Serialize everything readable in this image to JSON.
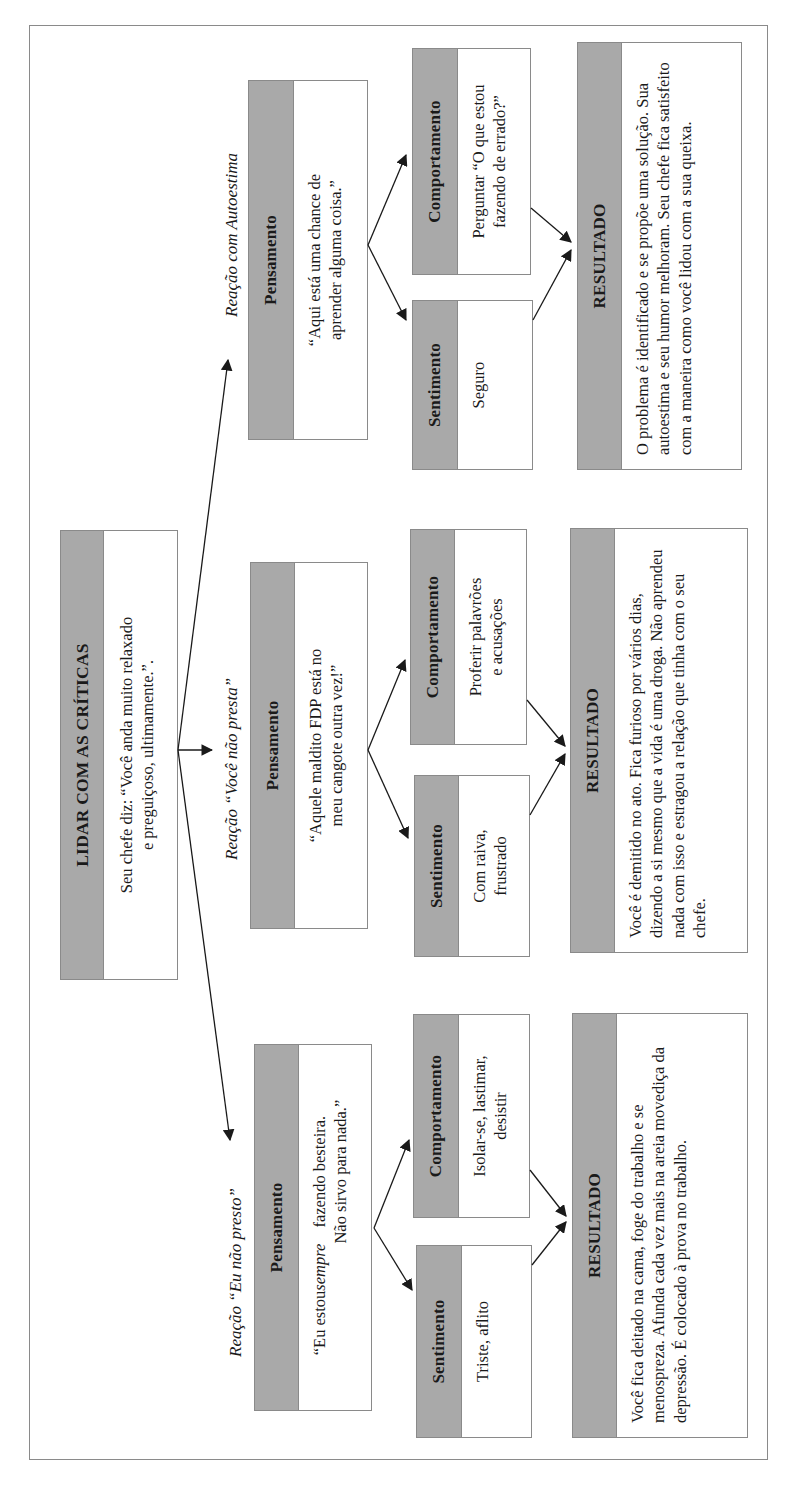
{
  "title_box": {
    "heading": "LIDAR COM AS CRÍTICAS",
    "text": "Seu chefe diz: “Você anda muito relaxado\ne preguiçoso, ultimamente.”."
  },
  "branches": [
    {
      "label": "Reação “Eu não presto”",
      "thought": {
        "heading": "Pensamento",
        "text_before": "“Eu estou ",
        "text_emphasis": "sempre",
        "text_after": " fazendo besteira.\nNão sirvo para nada.”"
      },
      "feeling": {
        "heading": "Sentimento",
        "text": "Triste, aflito"
      },
      "behavior": {
        "heading": "Comportamento",
        "text": "Isolar-se, lastimar,\ndesistir"
      },
      "result": {
        "heading": "RESULTADO",
        "text": "Você fica deitado na cama, foge do trabalho e se menospreza. Afunda cada vez mais na areia movediça da depressão. É colocado à prova no trabalho."
      }
    },
    {
      "label": "Reação “Você não presta”",
      "thought": {
        "heading": "Pensamento",
        "text": "“Aquele maldito FDP está no\nmeu cangote outra vez!”"
      },
      "feeling": {
        "heading": "Sentimento",
        "text": "Com raiva,\nfrustrado"
      },
      "behavior": {
        "heading": "Comportamento",
        "text": "Proferir palavrões\ne acusações"
      },
      "result": {
        "heading": "RESULTADO",
        "text": "Você é demitido no ato. Fica furioso por vários dias, dizendo a si mesmo que a vida é uma droga. Não aprendeu nada com isso e estragou a relação que tinha com o seu chefe."
      }
    },
    {
      "label": "Reação com Autoestima",
      "thought": {
        "heading": "Pensamento",
        "text": "“Aqui está uma chance de\naprender alguma coisa.”"
      },
      "feeling": {
        "heading": "Sentimento",
        "text": "Seguro"
      },
      "behavior": {
        "heading": "Comportamento",
        "text": "Perguntar “O que estou\nfazendo de errado?”"
      },
      "result": {
        "heading": "RESULTADO",
        "text": "O problema é identificado e se propõe uma solução. Sua autoestima e seu humor melhoram. Seu chefe fica satisfeito com a maneira como você lidou com a sua queixa."
      }
    }
  ],
  "colors": {
    "header_fill": "#a9a9a9",
    "border": "#8a8a8a",
    "arrow": "#1a1a1a"
  }
}
